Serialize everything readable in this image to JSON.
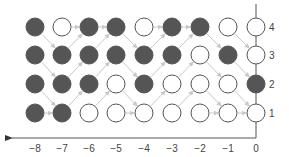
{
  "diagram": {
    "type": "state-transition-lattice",
    "x_axis": {
      "direction": "left",
      "ticks": [
        "−8",
        "−7",
        "−6",
        "−5",
        "−4",
        "−3",
        "−2",
        "−1",
        "0"
      ]
    },
    "y_axis": {
      "ticks": [
        "4",
        "3",
        "2",
        "1"
      ]
    },
    "colors": {
      "filled": "#555555",
      "empty": "#ffffff",
      "stroke": "#555555",
      "arrow": "#c8c8c8",
      "axis": "#555555"
    },
    "grid": {
      "columns": [
        -8,
        -7,
        -6,
        -5,
        -4,
        -3,
        -2,
        -1,
        0
      ],
      "rows": [
        4,
        3,
        2,
        1
      ],
      "states": [
        [
          1,
          0,
          1,
          1,
          0,
          1,
          1,
          0,
          0
        ],
        [
          1,
          1,
          1,
          1,
          1,
          1,
          0,
          1,
          0
        ],
        [
          1,
          1,
          1,
          0,
          1,
          0,
          0,
          0,
          1
        ],
        [
          1,
          1,
          0,
          0,
          0,
          0,
          0,
          0,
          0
        ]
      ]
    },
    "arrows": [
      {
        "from": [
          -8,
          4
        ],
        "to": [
          -7,
          3
        ]
      },
      {
        "from": [
          -8,
          3
        ],
        "to": [
          -7,
          2
        ]
      },
      {
        "from": [
          -8,
          2
        ],
        "to": [
          -7,
          1
        ]
      },
      {
        "from": [
          -8,
          1
        ],
        "to": [
          -7,
          1
        ]
      },
      {
        "from": [
          -7,
          4
        ],
        "to": [
          -6,
          4
        ]
      },
      {
        "from": [
          -7,
          3
        ],
        "to": [
          -6,
          4
        ]
      },
      {
        "from": [
          -7,
          2
        ],
        "to": [
          -6,
          3
        ]
      },
      {
        "from": [
          -7,
          1
        ],
        "to": [
          -6,
          2
        ]
      },
      {
        "from": [
          -6,
          4
        ],
        "to": [
          -5,
          4
        ]
      },
      {
        "from": [
          -6,
          3
        ],
        "to": [
          -5,
          4
        ]
      },
      {
        "from": [
          -6,
          2
        ],
        "to": [
          -5,
          3
        ]
      },
      {
        "from": [
          -6,
          1
        ],
        "to": [
          -5,
          2
        ]
      },
      {
        "from": [
          -5,
          4
        ],
        "to": [
          -4,
          3
        ]
      },
      {
        "from": [
          -5,
          3
        ],
        "to": [
          -4,
          2
        ]
      },
      {
        "from": [
          -5,
          2
        ],
        "to": [
          -4,
          1
        ]
      },
      {
        "from": [
          -5,
          1
        ],
        "to": [
          -4,
          1
        ]
      },
      {
        "from": [
          -4,
          4
        ],
        "to": [
          -3,
          4
        ]
      },
      {
        "from": [
          -4,
          3
        ],
        "to": [
          -3,
          4
        ]
      },
      {
        "from": [
          -4,
          2
        ],
        "to": [
          -3,
          3
        ]
      },
      {
        "from": [
          -4,
          1
        ],
        "to": [
          -3,
          2
        ]
      },
      {
        "from": [
          -3,
          4
        ],
        "to": [
          -2,
          4
        ]
      },
      {
        "from": [
          -3,
          3
        ],
        "to": [
          -2,
          4
        ]
      },
      {
        "from": [
          -3,
          2
        ],
        "to": [
          -2,
          3
        ]
      },
      {
        "from": [
          -3,
          1
        ],
        "to": [
          -2,
          2
        ]
      },
      {
        "from": [
          -2,
          4
        ],
        "to": [
          -1,
          3
        ]
      },
      {
        "from": [
          -2,
          3
        ],
        "to": [
          -1,
          2
        ]
      },
      {
        "from": [
          -2,
          2
        ],
        "to": [
          -1,
          1
        ]
      },
      {
        "from": [
          -2,
          1
        ],
        "to": [
          -1,
          1
        ]
      },
      {
        "from": [
          -1,
          4
        ],
        "to": [
          0,
          3
        ]
      },
      {
        "from": [
          -1,
          3
        ],
        "to": [
          0,
          2
        ]
      },
      {
        "from": [
          -1,
          2
        ],
        "to": [
          0,
          1
        ]
      },
      {
        "from": [
          -1,
          1
        ],
        "to": [
          0,
          1
        ]
      }
    ]
  }
}
